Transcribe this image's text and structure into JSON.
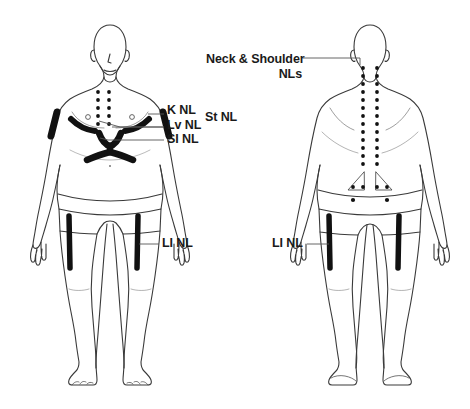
{
  "diagram": {
    "title_visible": false,
    "background_color": "#ffffff",
    "outline_color": "#3a3a3a",
    "marking_color": "#111111",
    "leader_line_color": "#555555",
    "text_color": "#1a1a1a",
    "figures": [
      {
        "id": "front-figure",
        "view": "anterior",
        "name": "front-body-figure"
      },
      {
        "id": "back-figure",
        "view": "posterior",
        "name": "back-body-figure"
      }
    ],
    "labels": [
      {
        "id": "k-nl",
        "text": "K NL",
        "name": "label-k-nl",
        "x": 167,
        "y": 110,
        "size": "lbl-md"
      },
      {
        "id": "st-nl",
        "text": "St NL",
        "name": "label-st-nl",
        "x": 201,
        "y": 117,
        "size": "lbl-md"
      },
      {
        "id": "lv-nl",
        "text": "Lv NL",
        "name": "label-lv-nl",
        "x": 167,
        "y": 123,
        "size": "lbl-md"
      },
      {
        "id": "si-nl",
        "text": "SI NL",
        "name": "label-si-nl",
        "x": 167,
        "y": 136,
        "size": "lbl-md"
      },
      {
        "id": "li-nl-front",
        "text": "LI NL",
        "name": "label-li-nl-front",
        "x": 162,
        "y": 240,
        "size": "lbl-md"
      },
      {
        "id": "li-nl-back",
        "text": "LI NL",
        "name": "label-li-nl-back",
        "x": 272,
        "y": 240,
        "size": "lbl-md"
      }
    ],
    "neck_shoulder_label": {
      "line1": "Neck & Shoulder",
      "line2": "NLs",
      "name": "label-neck-shoulder-nls",
      "x": 206,
      "y": 52
    },
    "markings": {
      "front": {
        "chest_dot_columns": 2,
        "chest_dots_per_column": 5,
        "shoulder_bands": 2,
        "clavicle_bands": 2,
        "sternal_y_marking": 1,
        "thigh_bands": 2,
        "nipple_circles": 2,
        "navel_dot": 1
      },
      "back": {
        "spine_dot_columns": 2,
        "spine_dots_per_column": 17,
        "sacral_triangles": 2,
        "sacral_dots": 4,
        "gluteal_dots": 2,
        "thigh_bands": 2
      }
    }
  }
}
